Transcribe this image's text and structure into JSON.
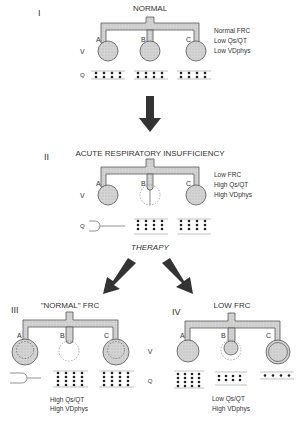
{
  "panels": [
    {
      "numeral": "I",
      "title": "NORMAL",
      "alveoli": [
        "A",
        "B",
        "C"
      ],
      "axis_v": "V",
      "axis_q": "Q",
      "notes": [
        "Normal FRC",
        "Low Qs/QT",
        "Low VDphys"
      ]
    },
    {
      "numeral": "II",
      "title": "ACUTE RESPIRATORY INSUFFICIENCY",
      "alveoli": [
        "A",
        "B",
        "C"
      ],
      "axis_v": "V",
      "axis_q": "Q",
      "notes": [
        "Low FRC",
        "High Qs/QT",
        "High VDphys"
      ]
    },
    {
      "numeral": "III",
      "title": "\"NORMAL\" FRC",
      "alveoli": [
        "A",
        "B",
        "C"
      ],
      "notes": [
        "High Qs/QT",
        "High VDphys"
      ]
    },
    {
      "numeral": "IV",
      "title": "LOW FRC",
      "alveoli": [
        "A",
        "B",
        "C"
      ],
      "notes": [
        "Low Qs/QT",
        "High VDphys"
      ]
    }
  ],
  "shared_axis": {
    "v": "V",
    "q": "Q"
  },
  "therapy_label": "THERAPY",
  "colors": {
    "fill": "#cfcfcf",
    "stroke": "#555555",
    "arrow": "#333333",
    "dot": "#222222"
  }
}
